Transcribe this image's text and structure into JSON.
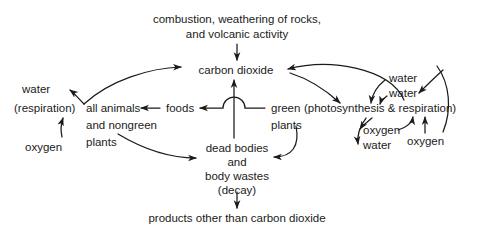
{
  "diagram": {
    "line_color": "#1b1b1b",
    "text_color": "#1b1b1b",
    "background": "#ffffff",
    "nodes": {
      "combustion_line1": "combustion, weathering of rocks,",
      "combustion_line2": "and volcanic activity",
      "carbon_dioxide": "carbon dioxide",
      "water_left": "water",
      "respiration_left": "(respiration)",
      "all_animals": "all animals",
      "and_nongreen": "and nongreen",
      "plants_left": "plants",
      "oxygen_left": "oxygen",
      "foods": "foods",
      "green": "green",
      "photosynthesis_respiration": "(photosynthesis & respiration)",
      "plants_right": "plants",
      "water_upper_right": "water",
      "water_lower_right": "water",
      "oxygen_inner_right": "oxygen",
      "water_inner_right": "water",
      "oxygen_far_right": "oxygen",
      "dead_bodies": "dead bodies",
      "and": "and",
      "body_wastes": "body wastes",
      "decay": "(decay)",
      "products": "products other than carbon dioxide"
    },
    "edges": [
      {
        "name": "combustion-to-carbon-dioxide",
        "from": "combustion, weathering of rocks, and volcanic activity",
        "to": "carbon dioxide"
      },
      {
        "name": "animals-to-carbon-dioxide",
        "from": "all animals and nongreen plants (respiration)",
        "to": "carbon dioxide"
      },
      {
        "name": "respiration-water-out",
        "from": "(respiration)",
        "to": "water"
      },
      {
        "name": "oxygen-to-respiration",
        "from": "oxygen",
        "to": "(respiration)"
      },
      {
        "name": "foods-to-animals",
        "from": "foods",
        "to": "all animals"
      },
      {
        "name": "green-plants-to-foods",
        "from": "green plants",
        "to": "foods"
      },
      {
        "name": "carbon-dioxide-to-green-plants",
        "from": "carbon dioxide",
        "to": "green plants"
      },
      {
        "name": "green-plants-to-carbon-dioxide",
        "from": "green plants (respiration)",
        "to": "carbon dioxide"
      },
      {
        "name": "water-into-photosynthesis",
        "from": "water",
        "to": "green plants"
      },
      {
        "name": "water-into-photosynthesis-2",
        "from": "water",
        "to": "green plants"
      },
      {
        "name": "photosynthesis-to-oxygen",
        "from": "green plants",
        "to": "oxygen"
      },
      {
        "name": "respiration-to-water",
        "from": "green plants",
        "to": "water"
      },
      {
        "name": "oxygen-into-plants",
        "from": "oxygen",
        "to": "green plants"
      },
      {
        "name": "animals-to-dead-bodies",
        "from": "all animals and nongreen plants",
        "to": "dead bodies and body wastes (decay)"
      },
      {
        "name": "green-plants-to-dead-bodies",
        "from": "green plants",
        "to": "dead bodies and body wastes (decay)"
      },
      {
        "name": "decay-to-carbon-dioxide",
        "from": "dead bodies and body wastes (decay)",
        "to": "carbon dioxide"
      },
      {
        "name": "decay-to-products",
        "from": "dead bodies and body wastes (decay)",
        "to": "products other than carbon dioxide"
      }
    ]
  }
}
